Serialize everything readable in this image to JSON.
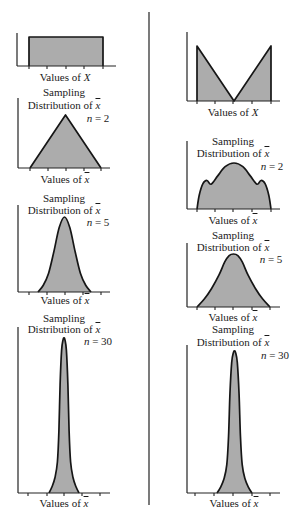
{
  "figure": {
    "columns": [
      "left",
      "right"
    ],
    "common": {
      "title_line1": "Sampling",
      "title_line2": "Distribution of",
      "values_of": "Values of",
      "pop_var": "X",
      "mean_var": "x",
      "n_var": "n"
    },
    "left": {
      "n2": "= 2",
      "n5": "= 5",
      "n30": "= 30"
    },
    "right": {
      "n2": "= 2",
      "n5": "= 5",
      "n30": "= 30"
    },
    "colors": {
      "fill": "#acacac",
      "stroke": "#161616",
      "background": "#ffffff"
    }
  },
  "chart_data": [
    {
      "type": "area",
      "column": "left",
      "title": "",
      "xlabel": "Values of X",
      "ylabel": "",
      "distribution": "population (uniform)",
      "n": null,
      "smooth": false,
      "points": [
        [
          0,
          0
        ],
        [
          0,
          1
        ],
        [
          1,
          1
        ],
        [
          1,
          0
        ]
      ]
    },
    {
      "type": "area",
      "column": "left",
      "title": "Sampling Distribution of x̄",
      "xlabel": "Values of x̄",
      "annotation": "n = 2",
      "n": 2,
      "distribution": "triangular",
      "smooth": false,
      "points": [
        [
          0,
          0
        ],
        [
          0.5,
          1
        ],
        [
          1,
          0
        ]
      ]
    },
    {
      "type": "area",
      "column": "left",
      "title": "Sampling Distribution of x̄",
      "xlabel": "Values of x̄",
      "annotation": "n = 5",
      "n": 5,
      "distribution": "bell-shaped",
      "smooth": true,
      "points": [
        [
          0,
          0
        ],
        [
          0.1,
          0.09
        ],
        [
          0.2,
          0.25
        ],
        [
          0.3,
          0.54
        ],
        [
          0.4,
          0.86
        ],
        [
          0.5,
          1
        ],
        [
          0.6,
          0.86
        ],
        [
          0.7,
          0.54
        ],
        [
          0.8,
          0.25
        ],
        [
          0.9,
          0.09
        ],
        [
          1,
          0
        ]
      ]
    },
    {
      "type": "area",
      "column": "left",
      "title": "Sampling Distribution of x̄",
      "xlabel": "Values of x̄",
      "annotation": "n = 30",
      "n": 30,
      "distribution": "approximately normal (narrow)",
      "smooth": true,
      "points": [
        [
          0,
          0
        ],
        [
          0.1,
          0.04
        ],
        [
          0.2,
          0.1
        ],
        [
          0.28,
          0.2
        ],
        [
          0.33,
          0.4
        ],
        [
          0.37,
          0.7
        ],
        [
          0.42,
          0.92
        ],
        [
          0.47,
          0.99
        ],
        [
          0.5,
          1
        ],
        [
          0.53,
          0.99
        ],
        [
          0.58,
          0.92
        ],
        [
          0.63,
          0.7
        ],
        [
          0.67,
          0.4
        ],
        [
          0.72,
          0.2
        ],
        [
          0.8,
          0.1
        ],
        [
          0.9,
          0.04
        ],
        [
          1,
          0
        ]
      ]
    },
    {
      "type": "area",
      "column": "right",
      "title": "",
      "xlabel": "Values of X",
      "distribution": "population (V-shaped / U-shaped)",
      "n": null,
      "smooth": false,
      "points": [
        [
          0,
          0
        ],
        [
          0,
          1
        ],
        [
          0.5,
          0
        ],
        [
          1,
          1
        ],
        [
          1,
          0
        ]
      ]
    },
    {
      "type": "area",
      "column": "right",
      "title": "Sampling Distribution of x̄",
      "xlabel": "Values of x̄",
      "annotation": "n = 2",
      "n": 2,
      "distribution": "trimodal",
      "smooth": true,
      "points": [
        [
          0,
          0
        ],
        [
          0.03,
          0.3
        ],
        [
          0.08,
          0.55
        ],
        [
          0.135,
          0.62
        ],
        [
          0.19,
          0.54
        ],
        [
          0.28,
          0.72
        ],
        [
          0.38,
          0.92
        ],
        [
          0.5,
          1
        ],
        [
          0.62,
          0.92
        ],
        [
          0.72,
          0.72
        ],
        [
          0.81,
          0.54
        ],
        [
          0.865,
          0.62
        ],
        [
          0.92,
          0.55
        ],
        [
          0.97,
          0.3
        ],
        [
          1,
          0
        ]
      ]
    },
    {
      "type": "area",
      "column": "right",
      "title": "Sampling Distribution of x̄",
      "xlabel": "Values of x̄",
      "annotation": "n = 5",
      "n": 5,
      "distribution": "broad bell-shaped",
      "smooth": true,
      "points": [
        [
          0,
          0
        ],
        [
          0.1,
          0.15
        ],
        [
          0.2,
          0.35
        ],
        [
          0.3,
          0.6
        ],
        [
          0.38,
          0.85
        ],
        [
          0.44,
          0.97
        ],
        [
          0.5,
          1
        ],
        [
          0.56,
          0.97
        ],
        [
          0.62,
          0.85
        ],
        [
          0.7,
          0.6
        ],
        [
          0.8,
          0.35
        ],
        [
          0.9,
          0.15
        ],
        [
          1,
          0
        ]
      ]
    },
    {
      "type": "area",
      "column": "right",
      "title": "Sampling Distribution of x̄",
      "xlabel": "Values of x̄",
      "annotation": "n = 30",
      "n": 30,
      "distribution": "approximately normal (narrow)",
      "smooth": true,
      "points": [
        [
          0,
          0
        ],
        [
          0.1,
          0.04
        ],
        [
          0.2,
          0.1
        ],
        [
          0.28,
          0.2
        ],
        [
          0.33,
          0.4
        ],
        [
          0.37,
          0.7
        ],
        [
          0.42,
          0.92
        ],
        [
          0.47,
          0.99
        ],
        [
          0.5,
          1
        ],
        [
          0.53,
          0.99
        ],
        [
          0.58,
          0.92
        ],
        [
          0.63,
          0.7
        ],
        [
          0.67,
          0.4
        ],
        [
          0.72,
          0.2
        ],
        [
          0.8,
          0.1
        ],
        [
          0.9,
          0.04
        ],
        [
          1,
          0
        ]
      ]
    }
  ]
}
